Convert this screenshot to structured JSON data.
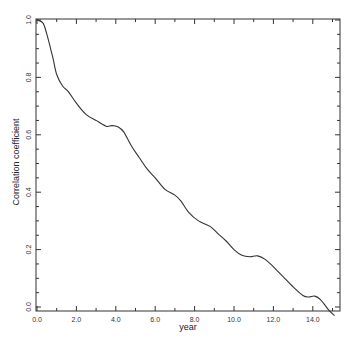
{
  "chart_data": {
    "type": "line",
    "title": "",
    "xlabel": "year",
    "ylabel": "Correlation coefficient",
    "xlim": [
      -0.05,
      15.4
    ],
    "ylim": [
      -0.02,
      1.0
    ],
    "grid": false,
    "legend": null,
    "x_ticks": [
      "0.0",
      "2.0",
      "4.0",
      "6.0",
      "8.0",
      "10.0",
      "12.0",
      "14.0"
    ],
    "y_ticks": [
      "0.0",
      "0.2",
      "0.4",
      "0.6",
      "0.8",
      "1.0"
    ],
    "series": [
      {
        "name": "Correlation coefficient",
        "x": [
          0.0,
          0.3,
          0.5,
          0.8,
          1.0,
          1.3,
          1.6,
          2.0,
          2.5,
          3.0,
          3.5,
          3.8,
          4.1,
          4.4,
          4.8,
          5.2,
          5.6,
          6.0,
          6.5,
          7.0,
          7.3,
          7.7,
          8.2,
          8.8,
          9.2,
          9.6,
          10.0,
          10.4,
          10.8,
          11.2,
          11.6,
          12.0,
          12.5,
          13.0,
          13.5,
          13.8,
          14.1,
          14.4,
          14.8,
          15.1
        ],
        "values": [
          1.0,
          0.99,
          0.95,
          0.87,
          0.81,
          0.77,
          0.75,
          0.71,
          0.67,
          0.65,
          0.63,
          0.632,
          0.628,
          0.61,
          0.56,
          0.52,
          0.48,
          0.45,
          0.41,
          0.39,
          0.37,
          0.33,
          0.3,
          0.28,
          0.255,
          0.23,
          0.2,
          0.18,
          0.175,
          0.178,
          0.165,
          0.14,
          0.105,
          0.07,
          0.04,
          0.035,
          0.038,
          0.025,
          -0.01,
          -0.03
        ]
      }
    ]
  }
}
